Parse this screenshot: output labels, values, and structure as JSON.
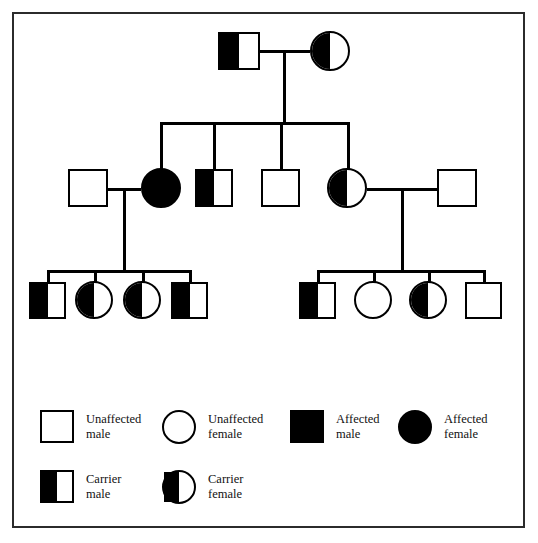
{
  "figure": {
    "kind": "pedigree-chart",
    "border_color": "#2b2b2b",
    "symbol_color": "#000000",
    "background": "#ffffff"
  },
  "legend": {
    "items": [
      {
        "key": "unaffected-male",
        "shape": "square",
        "fill": "none",
        "label": "Unaffected\nmale"
      },
      {
        "key": "unaffected-female",
        "shape": "circle",
        "fill": "none",
        "label": "Unaffected\nfemale"
      },
      {
        "key": "affected-male",
        "shape": "square",
        "fill": "full",
        "label": "Affected\nmale"
      },
      {
        "key": "affected-female",
        "shape": "circle",
        "fill": "full",
        "label": "Affected\nfemale"
      },
      {
        "key": "carrier-male",
        "shape": "square",
        "fill": "half",
        "label": "Carrier\nmale"
      },
      {
        "key": "carrier-female",
        "shape": "circle",
        "fill": "half",
        "label": "Carrier\nfemale"
      }
    ]
  },
  "pedigree": {
    "generations": [
      {
        "id": "I",
        "individuals": [
          {
            "id": "I-1",
            "sex": "male",
            "status": "carrier"
          },
          {
            "id": "I-2",
            "sex": "female",
            "status": "carrier"
          }
        ]
      },
      {
        "id": "II",
        "individuals": [
          {
            "id": "II-1",
            "sex": "male",
            "status": "unaffected"
          },
          {
            "id": "II-2",
            "sex": "female",
            "status": "affected"
          },
          {
            "id": "II-3",
            "sex": "male",
            "status": "carrier"
          },
          {
            "id": "II-4",
            "sex": "male",
            "status": "unaffected"
          },
          {
            "id": "II-5",
            "sex": "female",
            "status": "carrier"
          },
          {
            "id": "II-6",
            "sex": "male",
            "status": "unaffected"
          }
        ]
      },
      {
        "id": "III",
        "individuals": [
          {
            "id": "III-1",
            "sex": "male",
            "status": "carrier"
          },
          {
            "id": "III-2",
            "sex": "female",
            "status": "carrier"
          },
          {
            "id": "III-3",
            "sex": "female",
            "status": "carrier"
          },
          {
            "id": "III-4",
            "sex": "male",
            "status": "carrier"
          },
          {
            "id": "III-5",
            "sex": "male",
            "status": "carrier"
          },
          {
            "id": "III-6",
            "sex": "female",
            "status": "unaffected"
          },
          {
            "id": "III-7",
            "sex": "female",
            "status": "carrier"
          },
          {
            "id": "III-8",
            "sex": "male",
            "status": "unaffected"
          }
        ]
      }
    ],
    "matings": [
      {
        "id": "M1",
        "partners": [
          "I-1",
          "I-2"
        ],
        "children": [
          "II-2",
          "II-3",
          "II-4",
          "II-5"
        ]
      },
      {
        "id": "M2",
        "partners": [
          "II-1",
          "II-2"
        ],
        "children": [
          "III-1",
          "III-2",
          "III-3",
          "III-4"
        ]
      },
      {
        "id": "M3",
        "partners": [
          "II-5",
          "II-6"
        ],
        "children": [
          "III-5",
          "III-6",
          "III-7",
          "III-8"
        ]
      }
    ]
  }
}
